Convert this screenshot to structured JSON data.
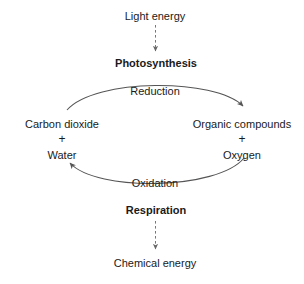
{
  "diagram": {
    "background_color": "#ffffff",
    "text_color": "#1a1a1a",
    "line_color": "#555555",
    "nodes": {
      "light_energy": "Light energy",
      "photosynthesis": "Photosynthesis",
      "carbon_dioxide": "Carbon dioxide",
      "water": "Water",
      "organic_compounds": "Organic compounds",
      "oxygen": "Oxygen",
      "respiration": "Respiration",
      "chemical_energy": "Chemical energy",
      "plus_left": "+",
      "plus_right": "+"
    },
    "arrow_labels": {
      "reduction": "Reduction",
      "oxidation": "Oxidation"
    },
    "edges": [
      {
        "name": "light-to-photosynthesis",
        "from": "Light energy",
        "to": "Photosynthesis",
        "style": "dashed",
        "direction": "down"
      },
      {
        "name": "reduction-arc",
        "from": "Carbon dioxide + Water",
        "to": "Organic compounds + Oxygen",
        "label": "Reduction",
        "style": "solid",
        "direction": "clockwise-top"
      },
      {
        "name": "oxidation-arc",
        "from": "Organic compounds + Oxygen",
        "to": "Carbon dioxide + Water",
        "label": "Oxidation",
        "style": "solid",
        "direction": "clockwise-bottom"
      },
      {
        "name": "respiration-to-chemical-energy",
        "from": "Respiration",
        "to": "Chemical energy",
        "style": "dashed",
        "direction": "down"
      }
    ]
  }
}
